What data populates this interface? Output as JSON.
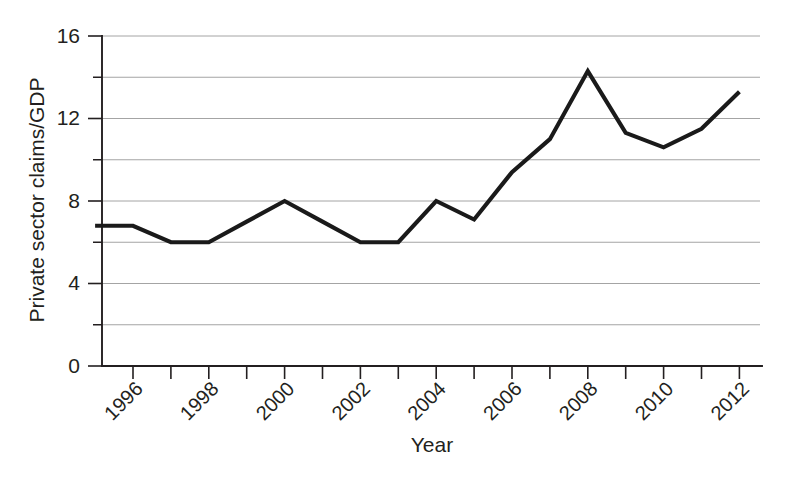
{
  "chart_data": {
    "type": "line",
    "title": "",
    "xlabel": "Year",
    "ylabel": "Private sector claims/GDP",
    "xlim": [
      1995,
      2012
    ],
    "ylim": [
      0,
      16
    ],
    "grid": true,
    "legend_position": "none",
    "x": [
      1995,
      1996,
      1997,
      1998,
      1999,
      2000,
      2001,
      2002,
      2003,
      2004,
      2005,
      2006,
      2007,
      2008,
      2009,
      2010,
      2011,
      2012
    ],
    "values": [
      6.8,
      6.8,
      6.0,
      6.0,
      7.0,
      8.0,
      7.0,
      6.0,
      6.0,
      8.0,
      7.1,
      9.4,
      11.0,
      14.3,
      11.3,
      10.6,
      11.5,
      13.3
    ],
    "series": [
      {
        "name": "Private sector claims/GDP",
        "values": [
          6.8,
          6.8,
          6.0,
          6.0,
          7.0,
          8.0,
          7.0,
          6.0,
          6.0,
          8.0,
          7.1,
          9.4,
          11.0,
          14.3,
          11.3,
          10.6,
          11.5,
          13.3
        ],
        "color": "#1a1a1a"
      }
    ],
    "y_ticks_major": [
      0,
      4,
      8,
      12,
      16
    ],
    "y_ticks_minor": [
      2,
      6,
      10,
      14
    ],
    "y_tick_labels": [
      "0",
      "4",
      "8",
      "12",
      "16"
    ],
    "x_ticks_all": [
      1996,
      1997,
      1998,
      1999,
      2000,
      2001,
      2002,
      2003,
      2004,
      2005,
      2006,
      2007,
      2008,
      2009,
      2010,
      2011,
      2012
    ],
    "x_tick_labels_shown": [
      "1996",
      "1998",
      "2000",
      "2002",
      "2004",
      "2006",
      "2008",
      "2010",
      "2012"
    ],
    "x_tick_label_rotation": -45
  },
  "axes": {
    "y_title": "Private sector claims/GDP",
    "x_title": "Year"
  },
  "colors": {
    "line": "#1a1a1a",
    "grid": "#9a9a9a",
    "axis": "#231f20",
    "background": "#ffffff"
  }
}
